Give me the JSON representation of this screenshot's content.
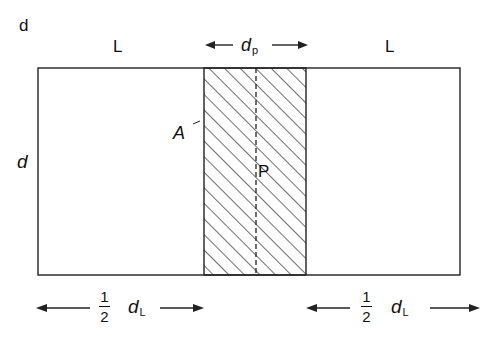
{
  "figure": {
    "corner_label": "d",
    "top_left_label": "L",
    "top_right_label": "L",
    "top_center_label": {
      "main": "d",
      "sub": "p"
    },
    "side_label": "d",
    "region_label_A": "A",
    "centerline_label_P": "P",
    "bottom_left": {
      "numerator": "1",
      "denominator": "2",
      "main": "d",
      "sub": "L"
    },
    "bottom_right": {
      "numerator": "1",
      "denominator": "2",
      "main": "d",
      "sub": "L"
    }
  }
}
